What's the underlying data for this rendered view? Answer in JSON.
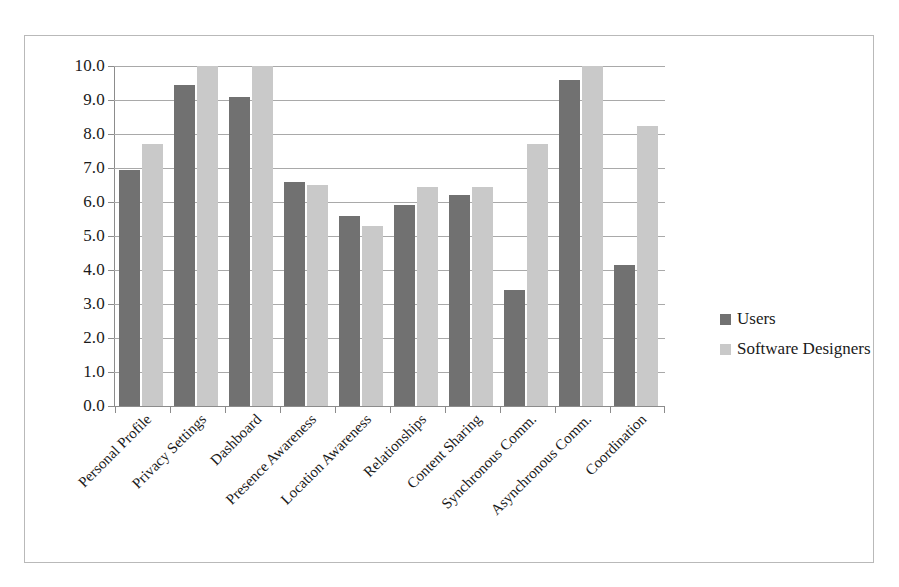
{
  "chart_data": {
    "type": "bar",
    "title": "",
    "subtitle": "",
    "xlabel": "",
    "ylabel": "",
    "ylim": [
      0,
      10
    ],
    "ytick_step": 1,
    "ytick_labels": [
      "10.0",
      "9.0",
      "8.0",
      "7.0",
      "6.0",
      "5.0",
      "4.0",
      "3.0",
      "2.0",
      "1.0",
      "0.0"
    ],
    "grid": true,
    "legend_position": "right",
    "orientation": "vertical",
    "categories": [
      "Personal Profile",
      "Privacy Settings",
      "Dashboard",
      "Presence Awareness",
      "Location Awareness",
      "Relationships",
      "Content Sharing",
      "Synchronous Comm.",
      "Asynchronous Comm.",
      "Coordination"
    ],
    "series": [
      {
        "name": "Users",
        "color": "#717171",
        "values": [
          6.95,
          9.45,
          9.1,
          6.6,
          5.6,
          5.9,
          6.2,
          3.4,
          9.6,
          4.15
        ]
      },
      {
        "name": "Software Designers",
        "color": "#c9c9c9",
        "values": [
          7.7,
          10.0,
          10.0,
          6.5,
          5.3,
          6.45,
          6.45,
          7.7,
          10.0,
          8.25
        ]
      }
    ]
  },
  "legend": {
    "items": [
      {
        "label": "Users",
        "color": "#717171"
      },
      {
        "label": "Software Designers",
        "color": "#c9c9c9"
      }
    ]
  },
  "colors": {
    "users": "#717171",
    "designers": "#c9c9c9",
    "gridline": "#a9a9a9",
    "axis": "#8c8c8c",
    "frame": "#b9b9b9",
    "text": "#1a1a1a",
    "background": "#ffffff"
  }
}
